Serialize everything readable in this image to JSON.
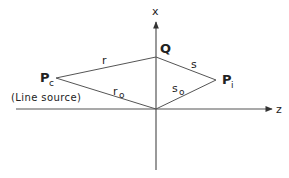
{
  "diagram": {
    "colors": {
      "stroke": "#555555",
      "text": "#222222",
      "background": "#ffffff"
    },
    "axes": {
      "x_label": "x",
      "z_label": "z"
    },
    "points": {
      "Q": {
        "label": "Q"
      },
      "Pc": {
        "label": "P",
        "subscript": "c",
        "annotation": "(Line source)"
      },
      "Pi": {
        "label": "P",
        "subscript": "i"
      },
      "O": {
        "label": ""
      }
    },
    "segments": {
      "r": {
        "label": "r",
        "from": "Pc",
        "to": "Q"
      },
      "s": {
        "label": "s",
        "from": "Q",
        "to": "Pi"
      },
      "r0": {
        "label": "r",
        "subscript": "o",
        "from": "Pc",
        "to": "O"
      },
      "s0": {
        "label": "s",
        "subscript": "o",
        "from": "O",
        "to": "Pi"
      }
    }
  }
}
